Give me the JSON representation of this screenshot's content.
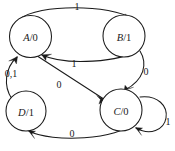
{
  "diagram": {
    "kind": "finite-state-machine",
    "width": 175,
    "height": 151,
    "background_color": "#ffffff",
    "stroke_color": "#1a1a1a",
    "states": [
      {
        "id": "A",
        "name": "A",
        "separator": "/",
        "output": "0",
        "label": "A/0",
        "cx": 30.5,
        "cy": 36.5,
        "r": 21
      },
      {
        "id": "B",
        "name": "B",
        "separator": "/",
        "output": "1",
        "label": "B/1",
        "cx": 124,
        "cy": 36,
        "r": 21
      },
      {
        "id": "C",
        "name": "C",
        "separator": "/",
        "output": "0",
        "label": "C/0",
        "cx": 121,
        "cy": 110,
        "r": 21
      },
      {
        "id": "D",
        "name": "D",
        "separator": "/",
        "output": "1",
        "label": "D/1",
        "cx": 26,
        "cy": 111,
        "r": 20
      }
    ],
    "transitions": [
      {
        "id": "A-to-B",
        "from": "A",
        "to": "B",
        "label": "1",
        "label_x": 77,
        "label_y": 6
      },
      {
        "id": "B-to-A",
        "from": "B",
        "to": "A",
        "label": "1",
        "label_x": 74,
        "label_y": 63
      },
      {
        "id": "A-to-C",
        "from": "A",
        "to": "C",
        "label": "0",
        "label_x": 59,
        "label_y": 84
      },
      {
        "id": "B-to-C",
        "from": "B",
        "to": "C",
        "label": "0",
        "label_x": 146,
        "label_y": 71
      },
      {
        "id": "C-to-D",
        "from": "C",
        "to": "D",
        "label": "0",
        "label_x": 72,
        "label_y": 133
      },
      {
        "id": "D-to-A",
        "from": "D",
        "to": "A",
        "label": "0,1",
        "label_x": 11,
        "label_y": 73
      },
      {
        "id": "C-to-C",
        "from": "C",
        "to": "C",
        "label": "1",
        "label_x": 168,
        "label_y": 121
      }
    ]
  }
}
